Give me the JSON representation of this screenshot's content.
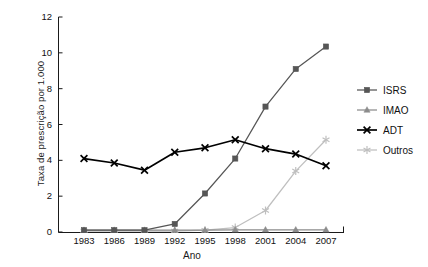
{
  "chart_data": {
    "type": "line",
    "title": "",
    "xlabel": "Ano",
    "ylabel": "Taxa de prescrição por 1.000",
    "categories": [
      "1983",
      "1986",
      "1989",
      "1992",
      "1995",
      "1998",
      "2001",
      "2004",
      "2007"
    ],
    "x": [
      1983,
      1986,
      1989,
      1992,
      1995,
      1998,
      2001,
      2004,
      2007
    ],
    "xlim": [
      1983,
      2007
    ],
    "ylim": [
      0,
      12
    ],
    "yticks": [
      0,
      2,
      4,
      6,
      8,
      10,
      12
    ],
    "ytick_labels": [
      "0",
      "2",
      "4",
      "6",
      "8",
      "10",
      "12"
    ],
    "grid": false,
    "legend_position": "right",
    "series": [
      {
        "name": "ISRS",
        "marker": "square",
        "color": "#565656",
        "values": [
          0.1,
          0.1,
          0.1,
          0.45,
          2.15,
          4.1,
          7.0,
          9.1,
          10.35
        ]
      },
      {
        "name": "IMAO",
        "marker": "triangle",
        "color": "#8c8c8c",
        "values": [
          0.1,
          0.1,
          0.1,
          0.1,
          0.1,
          0.12,
          0.12,
          0.12,
          0.12
        ]
      },
      {
        "name": "ADT",
        "marker": "x",
        "color": "#000000",
        "values": [
          4.1,
          3.85,
          3.45,
          4.45,
          4.7,
          5.15,
          4.65,
          4.35,
          3.7
        ]
      },
      {
        "name": "Outros",
        "marker": "asterisk",
        "color": "#bfbfbf",
        "values": [
          0.05,
          0.05,
          0.05,
          0.05,
          0.1,
          0.25,
          1.2,
          3.4,
          5.15
        ]
      }
    ]
  },
  "legend": {
    "items": [
      {
        "label": "ISRS"
      },
      {
        "label": "IMAO"
      },
      {
        "label": "ADT"
      },
      {
        "label": "Outros"
      }
    ]
  },
  "axes": {
    "x_title": "Ano",
    "y_title": "Taxa de prescrição por 1.000"
  }
}
